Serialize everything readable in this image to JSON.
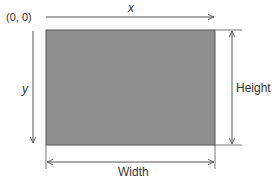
{
  "diagram": {
    "origin_label": "(0, 0)",
    "x_axis_label": "x",
    "y_axis_label": "y",
    "height_label": "Height",
    "width_label": "Width",
    "colors": {
      "rect_fill": "#8f8f8f",
      "rect_stroke": "#555555",
      "line": "#555555",
      "text": "#333333"
    }
  }
}
